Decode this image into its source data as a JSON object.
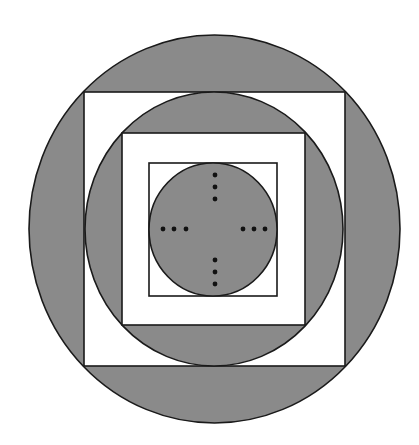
{
  "diagram": {
    "colors": {
      "fill": "#8a8a8a",
      "background": "#ffffff",
      "stroke": "#1a1a1a",
      "dot": "#111111"
    },
    "outer_circle": {
      "cx": 214.5,
      "cy": 229,
      "rx": 185.5,
      "ry": 194
    },
    "outer_square": {
      "x": 84,
      "y": 92,
      "w": 261,
      "h": 274
    },
    "middle_circle": {
      "cx": 214,
      "cy": 229,
      "rx": 129,
      "ry": 137
    },
    "middle_square": {
      "x": 122,
      "y": 133,
      "w": 183,
      "h": 192
    },
    "inner_square": {
      "x": 149,
      "y": 163,
      "w": 128,
      "h": 133
    },
    "inner_circle": {
      "cx": 213,
      "cy": 229.5,
      "rx": 64,
      "ry": 66.5
    },
    "dots": {
      "top": [
        [
          215,
          175
        ],
        [
          215,
          187
        ],
        [
          215,
          199
        ]
      ],
      "bottom": [
        [
          215,
          260
        ],
        [
          215,
          272
        ],
        [
          215,
          284
        ]
      ],
      "left": [
        [
          163,
          229
        ],
        [
          174,
          229
        ],
        [
          186,
          229
        ]
      ],
      "right": [
        [
          243,
          229
        ],
        [
          254,
          229
        ],
        [
          265,
          229
        ]
      ]
    }
  }
}
